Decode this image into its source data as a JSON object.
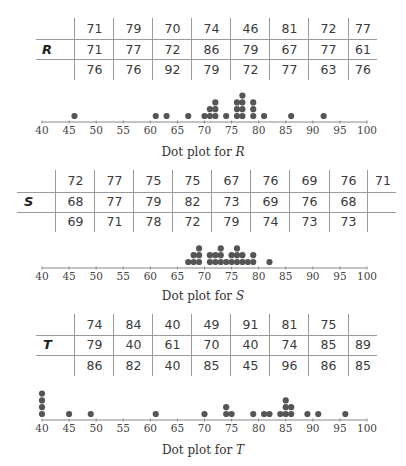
{
  "chart_data": [
    {
      "type": "table",
      "name": "R",
      "label": "R",
      "rows": [
        [
          71,
          79,
          70,
          74,
          46,
          81,
          72,
          77
        ],
        [
          71,
          77,
          72,
          86,
          79,
          67,
          77,
          61
        ],
        [
          76,
          76,
          92,
          79,
          72,
          77,
          63,
          76
        ]
      ]
    },
    {
      "type": "scatter",
      "subtype": "dot_plot",
      "title": "Dot plot for R",
      "title_prefix": "Dot plot for ",
      "title_var": "R",
      "xlim": [
        40,
        100
      ],
      "xticks": [
        40,
        45,
        50,
        55,
        60,
        65,
        70,
        75,
        80,
        85,
        90,
        95,
        100
      ],
      "grid": false,
      "points": {
        "46": 1,
        "61": 1,
        "63": 1,
        "67": 1,
        "70": 1,
        "71": 2,
        "72": 3,
        "74": 1,
        "76": 3,
        "77": 4,
        "79": 3,
        "81": 1,
        "86": 1,
        "92": 1
      }
    },
    {
      "type": "table",
      "name": "S",
      "label": "S",
      "rows": [
        [
          72,
          77,
          75,
          75,
          67,
          76,
          69,
          76,
          71
        ],
        [
          68,
          77,
          79,
          82,
          73,
          69,
          76,
          68,
          null
        ],
        [
          69,
          71,
          78,
          72,
          79,
          74,
          73,
          73,
          null
        ]
      ]
    },
    {
      "type": "scatter",
      "subtype": "dot_plot",
      "title": "Dot plot for S",
      "title_prefix": "Dot plot for ",
      "title_var": "S",
      "xlim": [
        40,
        100
      ],
      "xticks": [
        40,
        45,
        50,
        55,
        60,
        65,
        70,
        75,
        80,
        85,
        90,
        95,
        100
      ],
      "grid": false,
      "points": {
        "67": 1,
        "68": 2,
        "69": 3,
        "71": 2,
        "72": 2,
        "73": 3,
        "74": 1,
        "75": 2,
        "76": 3,
        "77": 2,
        "78": 1,
        "79": 2,
        "82": 1
      }
    },
    {
      "type": "table",
      "name": "T",
      "label": "T",
      "rows": [
        [
          74,
          84,
          40,
          49,
          91,
          81,
          75,
          null
        ],
        [
          79,
          40,
          61,
          70,
          40,
          74,
          85,
          89
        ],
        [
          86,
          82,
          40,
          85,
          45,
          96,
          86,
          85
        ]
      ]
    },
    {
      "type": "scatter",
      "subtype": "dot_plot",
      "title": "Dot plot for T",
      "title_prefix": "Dot plot for ",
      "title_var": "T",
      "xlim": [
        40,
        100
      ],
      "xticks": [
        40,
        45,
        50,
        55,
        60,
        65,
        70,
        75,
        80,
        85,
        90,
        95,
        100
      ],
      "grid": false,
      "points": {
        "40": 4,
        "45": 1,
        "49": 1,
        "61": 1,
        "70": 1,
        "74": 2,
        "75": 1,
        "79": 1,
        "81": 1,
        "82": 1,
        "84": 1,
        "85": 3,
        "86": 2,
        "89": 1,
        "91": 1,
        "96": 1
      }
    }
  ],
  "colors": {
    "dot": "#555555",
    "axis": "#888888",
    "grid_line": "#9a9a9a",
    "text": "#3a3a3a"
  },
  "panels": {
    "R": {
      "label": "R",
      "caption_prefix": "Dot plot for ",
      "caption_var": "R",
      "rows": [
        [
          "71",
          "79",
          "70",
          "74",
          "46",
          "81",
          "72",
          "77"
        ],
        [
          "71",
          "77",
          "72",
          "86",
          "79",
          "67",
          "77",
          "61"
        ],
        [
          "76",
          "76",
          "92",
          "79",
          "72",
          "77",
          "63",
          "76"
        ]
      ]
    },
    "S": {
      "label": "S",
      "caption_prefix": "Dot plot for ",
      "caption_var": "S",
      "rows": [
        [
          "72",
          "77",
          "75",
          "75",
          "67",
          "76",
          "69",
          "76",
          "71"
        ],
        [
          "68",
          "77",
          "79",
          "82",
          "73",
          "69",
          "76",
          "68",
          ""
        ],
        [
          "69",
          "71",
          "78",
          "72",
          "79",
          "74",
          "73",
          "73",
          ""
        ]
      ]
    },
    "T": {
      "label": "T",
      "caption_prefix": "Dot plot for ",
      "caption_var": "T",
      "rows": [
        [
          "74",
          "84",
          "40",
          "49",
          "91",
          "81",
          "75",
          ""
        ],
        [
          "79",
          "40",
          "61",
          "70",
          "40",
          "74",
          "85",
          "89"
        ],
        [
          "86",
          "82",
          "40",
          "85",
          "45",
          "96",
          "86",
          "85"
        ]
      ]
    }
  }
}
